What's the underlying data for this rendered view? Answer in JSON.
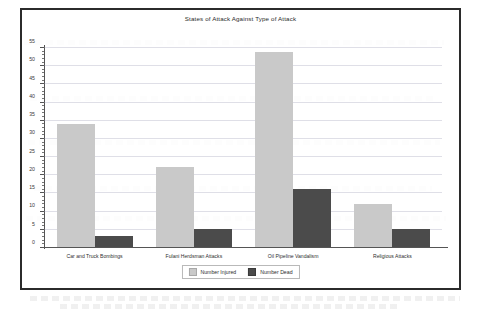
{
  "chart_data": {
    "type": "bar",
    "title": "States of Attack Against Type of Attack",
    "xlabel": "",
    "ylabel": "",
    "ylim": [
      0,
      55
    ],
    "ytick_step": 5,
    "grid": true,
    "legend_position": "bottom-center",
    "categories": [
      "Car and Truck Bombings",
      "Fulani Herdsman Attacks",
      "Oil Pipeline Vandalism",
      "Religious Attacks"
    ],
    "ytick_labels": [
      "0",
      "5",
      "10",
      "15",
      "20",
      "25",
      "30",
      "35",
      "40",
      "45",
      "50",
      "55"
    ],
    "series": [
      {
        "name": "Number Injured",
        "color": "#c9c9c9",
        "values": [
          34,
          22,
          54,
          12
        ]
      },
      {
        "name": "Number Dead",
        "color": "#4b4b4b",
        "values": [
          3,
          5,
          16,
          5
        ]
      }
    ]
  },
  "colors": {
    "injured": "#c9c9c9",
    "dead": "#4b4b4b",
    "frame": "#2b2b2b",
    "grid": "#9696af"
  }
}
